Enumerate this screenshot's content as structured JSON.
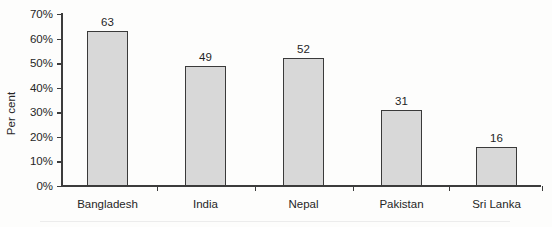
{
  "chart_data": {
    "type": "bar",
    "title": "",
    "xlabel": "",
    "ylabel": "Per cent",
    "categories": [
      "Bangladesh",
      "India",
      "Nepal",
      "Pakistan",
      "Sri Lanka"
    ],
    "values": [
      63,
      49,
      52,
      31,
      16
    ],
    "value_labels": [
      "63",
      "49",
      "52",
      "31",
      "16"
    ],
    "ylim": [
      0,
      70
    ],
    "ytick_values": [
      0,
      10,
      20,
      30,
      40,
      50,
      60,
      70
    ],
    "ytick_labels": [
      "0%",
      "10%",
      "20%",
      "30%",
      "40%",
      "50%",
      "60%",
      "70%"
    ],
    "grid": false,
    "legend": null,
    "legend_position": "none",
    "bar_fill_color": "#d8d8d8",
    "bar_border_color": "#3a3a3a",
    "axis_color": "#3c3c3c",
    "text_color": "#262626",
    "background_color": "#fdfdfc"
  }
}
